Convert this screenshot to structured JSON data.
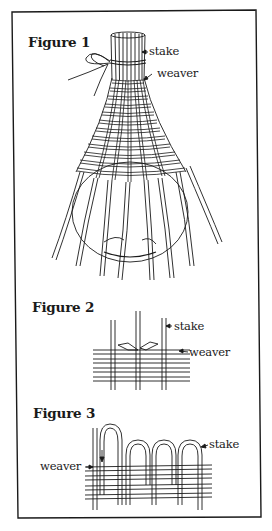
{
  "figures": [
    {
      "title": "Figure 1",
      "labels": {
        "stake": "stake",
        "weaver": "weaver"
      },
      "description": "Basket woven over a round bulb form; stakes tied at top, weavers interlaced, stakes flaring out at bottom"
    },
    {
      "title": "Figure 2",
      "labels": {
        "stake": "stake",
        "weaver": "weaver"
      },
      "description": "Close-up of weaver ends overlapping behind a stake"
    },
    {
      "title": "Figure 3",
      "labels": {
        "stake": "stake",
        "weaver": "weaver"
      },
      "description": "Stakes bent over and tucked down into the weave to finish the rim"
    }
  ],
  "colors": {
    "ink": "#1a1a1a",
    "paper": "#ffffff"
  }
}
